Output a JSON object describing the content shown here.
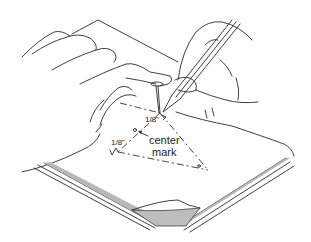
{
  "illustration": {
    "subject": "pinning a center mark through layered paper with a pin and pencil",
    "labels": {
      "top_margin": "1/8\"",
      "left_margin": "1/8\"",
      "center_mark_line1": "center",
      "center_mark_line2": "mark"
    },
    "colors": {
      "line": "#2a2a2a",
      "shade": "#b8b8b8",
      "background": "#ffffff"
    }
  }
}
